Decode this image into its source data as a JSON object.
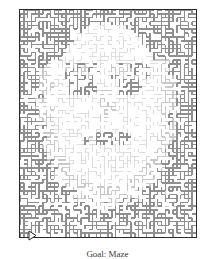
{
  "figure": {
    "kind": "maze",
    "title": "Goal: Maze",
    "caption": "Goal: Maze",
    "border_color": "#2b2b2b",
    "background_color": "#ffffff",
    "wall_color_dark": "#8f8f8f",
    "wall_color_light": "#c9c9c9",
    "path_color": "#ffffff",
    "width_px": 178,
    "height_px": 229,
    "grid_columns": 46,
    "grid_rows": 59,
    "cell_size_px": 3.85,
    "depicts": "human face portrait rendered as shaded maze walls"
  },
  "markers": {
    "entrance": {
      "label": "entrance-arrow",
      "glyph": "triangle-right",
      "side": "left",
      "x_px": 9,
      "y_px": 221
    },
    "exit": {
      "label": "exit-arrow",
      "glyph": "triangle-right",
      "side": "right",
      "x_px": 197,
      "y_px": 162
    }
  },
  "chart_data": {
    "type": "heatmap",
    "title": "Goal: Maze",
    "xlabel": "",
    "ylabel": "",
    "grid": false,
    "legend": "none",
    "note": "Shading density of maze walls encodes a grayscale portrait; dark clusters form hair/outline, light clusters form facial highlights.",
    "categories": [
      "light",
      "mid",
      "dark"
    ],
    "values": [
      38,
      34,
      28
    ]
  }
}
